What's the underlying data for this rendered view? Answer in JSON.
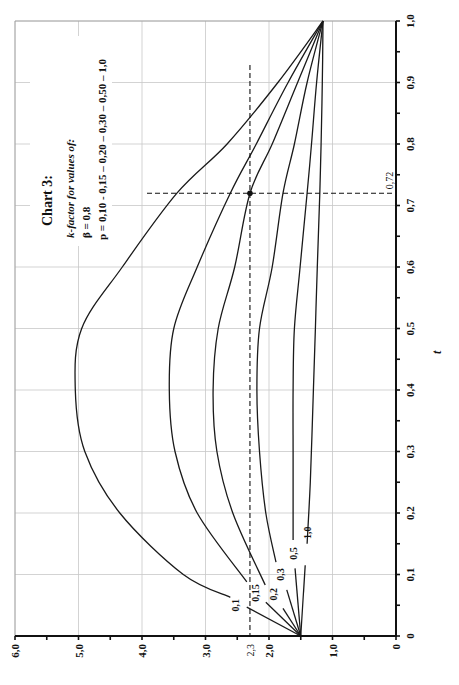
{
  "chart_data": {
    "type": "line",
    "title": "Chart 3:",
    "subtitle_lines": [
      "k-factor for values of:",
      "β = 0,8",
      "p = 0,10 - 0,15 – 0,20 – 0,30 – 0,50 – 1,0"
    ],
    "orientation": "rotated 90° counter-clockwise (k axis along bottom, t axis on right)",
    "xlabel": "t",
    "ylabel": "k",
    "xlim": [
      0,
      1.0
    ],
    "ylim": [
      0,
      6.0
    ],
    "grid": true,
    "t_ticks": [
      "0",
      "0,1",
      "0,2",
      "0,3",
      "0,4",
      "0,5",
      "0,6",
      "0,7",
      "0,8",
      "0,9",
      "1,0"
    ],
    "k_ticks": [
      "0",
      "1,0",
      "2,0",
      "3,0",
      "4,0",
      "5,0",
      "6,0"
    ],
    "annotations": {
      "k_marker": {
        "label": "2,3",
        "value": 2.3
      },
      "t_marker": {
        "label": "0,72",
        "value": 0.72
      },
      "point": {
        "t": 0.72,
        "k": 2.3
      }
    },
    "series": [
      {
        "name": "0,1",
        "p": 0.1,
        "t": [
          0.063,
          0.1,
          0.2,
          0.3,
          0.4,
          0.5,
          0.6,
          0.72,
          0.8,
          0.9,
          1.0
        ],
        "k": [
          2.61,
          3.35,
          4.35,
          4.9,
          5.05,
          4.95,
          4.31,
          3.45,
          2.66,
          1.86,
          1.15
        ],
        "start_segment": {
          "t": [
            0.0,
            0.047
          ],
          "k": [
            1.5,
            2.35
          ]
        },
        "label_pos": {
          "t": 0.05,
          "k": 2.53
        }
      },
      {
        "name": "0,15",
        "p": 0.15,
        "t": [
          0.088,
          0.2,
          0.3,
          0.4,
          0.5,
          0.6,
          0.72,
          0.8,
          0.9,
          1.0
        ],
        "k": [
          2.35,
          3.13,
          3.48,
          3.57,
          3.5,
          3.13,
          2.61,
          2.2,
          1.7,
          1.15
        ],
        "start_segment": {
          "t": [
            0.0,
            0.055
          ],
          "k": [
            1.5,
            2.05
          ]
        },
        "label_pos": {
          "t": 0.07,
          "k": 2.22
        }
      },
      {
        "name": "0,2",
        "p": 0.2,
        "t": [
          0.083,
          0.2,
          0.3,
          0.4,
          0.5,
          0.6,
          0.72,
          0.8,
          0.9,
          1.0
        ],
        "k": [
          2.06,
          2.57,
          2.82,
          2.88,
          2.8,
          2.54,
          2.3,
          1.95,
          1.55,
          1.15
        ],
        "start_segment": {
          "t": [
            0.0,
            0.045
          ],
          "k": [
            1.5,
            1.78
          ]
        },
        "label_pos": {
          "t": 0.068,
          "k": 1.93
        }
      },
      {
        "name": "0,3",
        "p": 0.3,
        "t": [
          0.12,
          0.2,
          0.3,
          0.4,
          0.5,
          0.6,
          0.72,
          0.8,
          0.9,
          1.0
        ],
        "k": [
          1.89,
          2.05,
          2.15,
          2.19,
          2.15,
          1.95,
          1.78,
          1.6,
          1.4,
          1.15
        ],
        "start_segment": {
          "t": [
            0.0,
            0.075
          ],
          "k": [
            1.5,
            1.72
          ]
        },
        "label_pos": {
          "t": 0.1,
          "k": 1.82
        }
      },
      {
        "name": "0,5",
        "p": 0.5,
        "t": [
          0.156,
          0.25,
          0.3,
          0.4,
          0.5,
          0.6,
          0.72,
          0.8,
          0.9,
          1.0
        ],
        "k": [
          1.62,
          1.62,
          1.62,
          1.62,
          1.6,
          1.51,
          1.4,
          1.33,
          1.25,
          1.15
        ],
        "start_segment": {
          "t": [
            0.0,
            0.11
          ],
          "k": [
            1.5,
            1.59
          ]
        },
        "label_pos": {
          "t": 0.134,
          "k": 1.62
        }
      },
      {
        "name": "1,0",
        "p": 1.0,
        "t": [
          0.15,
          0.25,
          0.4,
          0.5,
          0.6,
          0.72,
          0.8,
          0.9,
          1.0
        ],
        "k": [
          1.4,
          1.35,
          1.3,
          1.27,
          1.24,
          1.2,
          1.18,
          1.16,
          1.15
        ],
        "start_segment": {
          "t": [
            0.0,
            0.115
          ],
          "k": [
            1.5,
            1.43
          ]
        },
        "label_pos": {
          "t": 0.168,
          "k": 1.4
        }
      }
    ]
  }
}
